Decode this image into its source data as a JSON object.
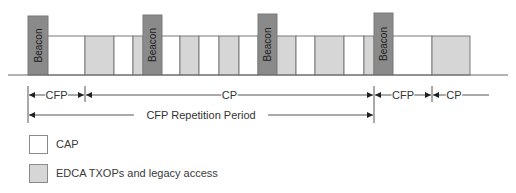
{
  "diagram": {
    "beacon_label": "Beacon",
    "colors": {
      "beacon": "#8a8a8a",
      "cap": "#ffffff",
      "edca": "#d6d6d6",
      "stroke": "#7a7a7a",
      "line": "#555555"
    },
    "blocks": [
      {
        "type": "beacon",
        "x": 28,
        "w": 20,
        "top": 16
      },
      {
        "type": "cap",
        "x": 48,
        "w": 37
      },
      {
        "type": "edca",
        "x": 85,
        "w": 29
      },
      {
        "type": "cap",
        "x": 114,
        "w": 19
      },
      {
        "type": "edca",
        "x": 133,
        "w": 10
      },
      {
        "type": "beacon",
        "x": 143,
        "w": 19,
        "top": 15
      },
      {
        "type": "cap",
        "x": 162,
        "w": 18
      },
      {
        "type": "edca",
        "x": 180,
        "w": 19
      },
      {
        "type": "cap",
        "x": 199,
        "w": 20
      },
      {
        "type": "edca",
        "x": 219,
        "w": 20
      },
      {
        "type": "cap",
        "x": 239,
        "w": 19
      },
      {
        "type": "beacon",
        "x": 258,
        "w": 19,
        "top": 14
      },
      {
        "type": "edca",
        "x": 277,
        "w": 19
      },
      {
        "type": "cap",
        "x": 296,
        "w": 19
      },
      {
        "type": "edca",
        "x": 315,
        "w": 29
      },
      {
        "type": "cap",
        "x": 344,
        "w": 20
      },
      {
        "type": "edca",
        "x": 364,
        "w": 10
      },
      {
        "type": "beacon",
        "x": 374,
        "w": 19,
        "top": 13
      },
      {
        "type": "cap",
        "x": 393,
        "w": 39
      },
      {
        "type": "edca",
        "x": 432,
        "w": 38
      }
    ],
    "intervals": [
      {
        "label": "CFP",
        "from": 28,
        "to": 85,
        "row": 1
      },
      {
        "label": "CP",
        "from": 85,
        "to": 374,
        "row": 1
      },
      {
        "label": "CFP",
        "from": 374,
        "to": 432,
        "row": 1
      },
      {
        "label": "CP",
        "from": 432,
        "to": 490,
        "row": 1,
        "open_end": true
      },
      {
        "label": "CFP Repetition Period",
        "from": 28,
        "to": 374,
        "row": 2
      }
    ]
  },
  "legend": {
    "items": [
      {
        "label": "CAP",
        "color": "#ffffff"
      },
      {
        "label": "EDCA TXOPs and legacy access",
        "color": "#d6d6d6"
      }
    ]
  }
}
